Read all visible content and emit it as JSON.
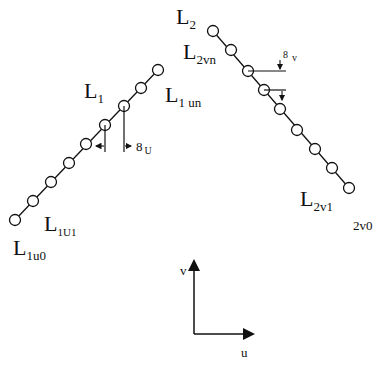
{
  "diagram": {
    "line1": {
      "label_main": "L",
      "label_main_sub": "1",
      "label_end": "L",
      "label_end_sub": "1 un",
      "label_first": "L",
      "label_first_sub": "1U1",
      "label_origin": "L",
      "label_origin_sub": "1u0",
      "spacing_label": "8",
      "spacing_sub": "U",
      "points": [
        [
          15,
          220
        ],
        [
          33,
          201
        ],
        [
          51,
          182
        ],
        [
          69,
          163
        ],
        [
          86,
          144
        ],
        [
          105,
          125
        ],
        [
          124,
          106
        ],
        [
          141,
          88
        ],
        [
          158,
          70
        ]
      ]
    },
    "line2": {
      "label_main": "L",
      "label_main_sub": "2",
      "label_end": "L",
      "label_end_sub": "2vn",
      "label_first": "L",
      "label_first_sub": "2v1",
      "label_origin": "2v0",
      "spacing_label": "8",
      "spacing_sub": "v",
      "points": [
        [
          213,
          31
        ],
        [
          231,
          50
        ],
        [
          248,
          71
        ],
        [
          264,
          90
        ],
        [
          280,
          109
        ],
        [
          297,
          130
        ],
        [
          315,
          149
        ],
        [
          332,
          168
        ],
        [
          349,
          188
        ]
      ]
    },
    "axes": {
      "vertical_label": "v",
      "horizontal_label": "u"
    }
  }
}
